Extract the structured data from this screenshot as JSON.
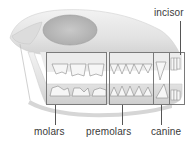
{
  "diagram": {
    "labels": {
      "incisor": "incisor",
      "molars": "molars",
      "premolars": "premolars",
      "canine": "canine"
    },
    "colors": {
      "bone": "#e4e4e4",
      "bone_shadow": "#b8b8b8",
      "orbit": "#bdbdbd",
      "tooth": "#f4f4f4",
      "outline": "#7a7a7a",
      "text": "#3a3a3a"
    }
  }
}
